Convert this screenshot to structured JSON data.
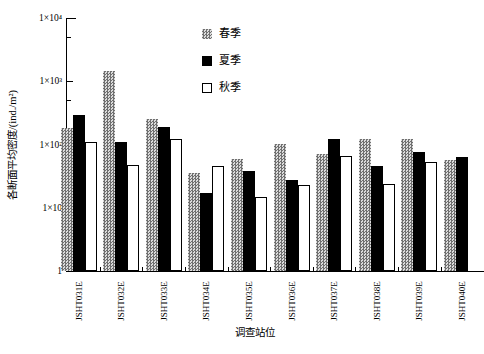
{
  "figure": {
    "x_axis_label": "调查站位",
    "y_axis_label": "各断面平均密度/(ind./m²)"
  },
  "y_ticks": [
    "1×10⁴",
    "1×10³",
    "1×10²",
    "1×10",
    "1"
  ],
  "legend": {
    "items": [
      {
        "label": "春季",
        "style": "hatch"
      },
      {
        "label": "夏季",
        "style": "black"
      },
      {
        "label": "秋季",
        "style": "white"
      }
    ]
  },
  "colors": {
    "axis": "#000000",
    "spring_hatch_dark": "#707070",
    "spring_hatch_light": "#dcdcdc",
    "summer_fill": "#000000",
    "autumn_fill": "#ffffff"
  },
  "chart_data": {
    "type": "bar",
    "scale": "log",
    "ylim": [
      1,
      10000
    ],
    "grid": false,
    "legend_position": "top-center-inside",
    "title": "",
    "xlabel": "调查站位",
    "ylabel": "各断面平均密度/(ind./m²)",
    "categories": [
      "JSHT031E",
      "JSHT032E",
      "JSHT033E",
      "JSHT034E",
      "JSHT035E",
      "JSHT036E",
      "JSHT037E",
      "JSHT038E",
      "JSHT039E",
      "JSHT040E"
    ],
    "series": [
      {
        "name": "春季",
        "style": "hatch",
        "values": [
          180,
          1450,
          255,
          35,
          60,
          100,
          72,
          120,
          120,
          56
        ]
      },
      {
        "name": "夏季",
        "style": "black",
        "values": [
          290,
          110,
          190,
          17,
          38,
          27,
          120,
          46,
          76,
          64
        ]
      },
      {
        "name": "秋季",
        "style": "white",
        "values": [
          110,
          48,
          120,
          45,
          15,
          23,
          65,
          24,
          52,
          null
        ]
      }
    ]
  }
}
